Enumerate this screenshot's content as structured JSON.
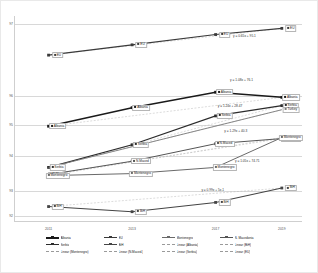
{
  "chart": {
    "type": "line",
    "title": "",
    "xlabel": "",
    "ylabel": "",
    "bg_color": "#ffffff",
    "grid": true,
    "grid_color": "#d8d8d8"
  },
  "axes": {
    "x_ticks": [
      "2011",
      "2013",
      "2017",
      "2019"
    ],
    "x_positions_pct": [
      12,
      41,
      70,
      93
    ],
    "y_ticks": [
      "97",
      "96",
      "95",
      "94",
      "93",
      "92"
    ],
    "y_positions_pct": [
      4,
      39,
      53,
      68,
      85,
      97
    ],
    "ylim": [
      92,
      97
    ]
  },
  "chart_data": {
    "type": "line",
    "title": "",
    "xlabel": "",
    "ylabel": "",
    "grid": true,
    "legend_position": "bottom",
    "categories": [
      "2011",
      "2013",
      "2017",
      "2019"
    ],
    "ylim": [
      92,
      97
    ],
    "series": [
      {
        "name": "Albania",
        "color": "#1a1a1a",
        "width": 1.5,
        "marker": "square",
        "x_pct": [
          12,
          41,
          70,
          93
        ],
        "y_pct": [
          53.5,
          44.5,
          37.0,
          39.5
        ],
        "labels": [
          "Albania",
          "Albania",
          "Albania",
          "Albania"
        ],
        "label_side": [
          "right",
          "right",
          "right",
          "right"
        ]
      },
      {
        "name": "Serbia",
        "color": "#2b2b2b",
        "width": 1.2,
        "marker": "square",
        "x_pct": [
          12,
          41,
          70,
          93
        ],
        "y_pct": [
          73.5,
          62.5,
          48.5,
          43.5
        ],
        "labels": [
          "Serbia",
          "Serbia",
          "Serbia",
          "Serbia"
        ],
        "label_side": [
          "right",
          "right",
          "right",
          "right"
        ]
      },
      {
        "name": "N. Macedonia",
        "color": "#555555",
        "width": 1.0,
        "marker": "square",
        "x_pct": [
          12,
          41,
          70,
          93
        ],
        "y_pct": [
          77.0,
          70.5,
          62.0,
          59.5
        ],
        "labels": [
          "N.Maced",
          "N.Maced",
          "N.Maced",
          "N.Maced"
        ],
        "label_side": [
          "right",
          "right",
          "right",
          "right"
        ]
      },
      {
        "name": "Montenegro",
        "color": "#6a6a6a",
        "width": 1.0,
        "marker": "square",
        "x_pct": [
          12,
          41,
          70,
          93
        ],
        "y_pct": [
          77.5,
          76.5,
          73.5,
          59.0
        ],
        "labels": [
          "Montenegro",
          "Montenegro",
          "Montenegro",
          "Montenegro"
        ],
        "label_side": [
          "right",
          "right",
          "right",
          "right"
        ]
      },
      {
        "name": "EU",
        "color": "#3a3a3a",
        "width": 1.1,
        "marker": "square",
        "x_pct": [
          12,
          41,
          70,
          93
        ],
        "y_pct": [
          19.0,
          14.0,
          9.0,
          6.0
        ],
        "labels": [
          "EU",
          "EU",
          "EU",
          "EU"
        ],
        "label_side": [
          "right",
          "right",
          "right",
          "right"
        ]
      },
      {
        "name": "BiH",
        "color": "#444444",
        "width": 1.1,
        "marker": "square",
        "x_pct": [
          12,
          41,
          70,
          93
        ],
        "y_pct": [
          92.5,
          95.0,
          90.5,
          83.5
        ],
        "labels": [
          "BiH",
          "BiH",
          "BiH",
          "BiH"
        ],
        "label_side": [
          "right",
          "right",
          "right",
          "right"
        ]
      },
      {
        "name": "Turkey",
        "color": "#7a7a7a",
        "width": 0.9,
        "marker": "none",
        "x_pct": [
          12,
          93
        ],
        "y_pct": [
          73.5,
          45.5
        ],
        "labels": [
          "",
          "Turkey"
        ],
        "label_side": [
          "right",
          "right"
        ]
      }
    ],
    "trendlines": [
      {
        "name": "Linear (EU)",
        "equation": "y = 0.65x + 95.1",
        "eq_x_pct": 80,
        "eq_y_pct": 9.5,
        "style": "dashed",
        "color": "#9a9a9a"
      },
      {
        "name": "Linear (Albania)",
        "equation": "y = 1.08x + 76.1",
        "eq_x_pct": 79,
        "eq_y_pct": 31.0,
        "style": "dashed",
        "color": "#9a9a9a"
      },
      {
        "name": "Linear (Turkey)",
        "equation": "y = 1.24x + 28.47",
        "eq_x_pct": 75,
        "eq_y_pct": 43.5,
        "style": "dashed",
        "color": "#9a9a9a"
      },
      {
        "name": "Linear (N.Maced.)",
        "equation": "y = 1.29x + 40.3",
        "eq_x_pct": 77,
        "eq_y_pct": 56.0,
        "style": "dashed",
        "color": "#9a9a9a"
      },
      {
        "name": "Linear (Montenegro)",
        "equation": "y = 1.05x + 74.71",
        "eq_x_pct": 81,
        "eq_y_pct": 70.5,
        "style": "dashed",
        "color": "#9a9a9a"
      },
      {
        "name": "Linear (Serbia)",
        "equation": "y = 0.99x + 5x.1",
        "eq_x_pct": 69,
        "eq_y_pct": 84.5,
        "style": "dashed",
        "color": "#9a9a9a"
      }
    ]
  },
  "legend": {
    "items": [
      {
        "label": "Albania",
        "color": "#1a1a1a",
        "style": "solid",
        "marker": true,
        "width": 1.6
      },
      {
        "label": "EU",
        "color": "#3a3a3a",
        "style": "solid",
        "marker": true,
        "width": 1.2
      },
      {
        "label": "Montenegro",
        "color": "#6a6a6a",
        "style": "solid",
        "marker": true,
        "width": 1.0
      },
      {
        "label": "N. Macedonia",
        "color": "#555555",
        "style": "solid",
        "marker": true,
        "width": 1.0
      },
      {
        "label": "Serbia",
        "color": "#2b2b2b",
        "style": "solid",
        "marker": true,
        "width": 1.3
      },
      {
        "label": "BiH",
        "color": "#444444",
        "style": "solid",
        "marker": true,
        "width": 1.2
      },
      {
        "label": "Linear (Albania)",
        "color": "#9a9a9a",
        "style": "dashed",
        "marker": false,
        "width": 0.8
      },
      {
        "label": "Linear (BiH)",
        "color": "#9a9a9a",
        "style": "dashed",
        "marker": false,
        "width": 0.8
      },
      {
        "label": "Linear (Montenegro)",
        "color": "#9a9a9a",
        "style": "dashed",
        "marker": false,
        "width": 0.8
      },
      {
        "label": "Linear (N.Maced.)",
        "color": "#9a9a9a",
        "style": "dashed",
        "marker": false,
        "width": 0.8
      },
      {
        "label": "Linear (Serbia)",
        "color": "#9a9a9a",
        "style": "dashed",
        "marker": false,
        "width": 0.8
      },
      {
        "label": "Linear (EU)",
        "color": "#9a9a9a",
        "style": "dashed",
        "marker": false,
        "width": 0.8
      }
    ]
  }
}
